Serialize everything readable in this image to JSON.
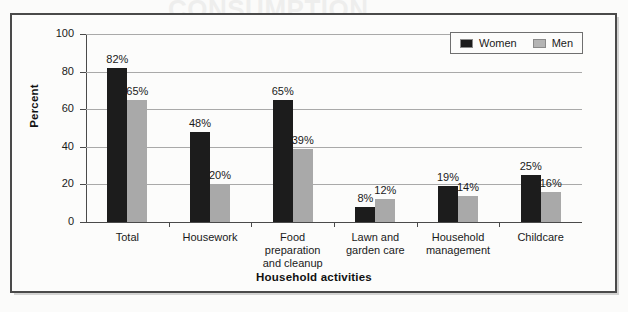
{
  "chart_data": {
    "type": "bar",
    "title": "",
    "xlabel": "Household activities",
    "ylabel": "Percent",
    "ylim": [
      0,
      100
    ],
    "yticks": [
      "0",
      "20",
      "40",
      "60",
      "80",
      "100"
    ],
    "grid": true,
    "legend_position": "top-right",
    "value_suffix": "%",
    "categories": [
      "Total",
      "Housework",
      "Food preparation and cleanup",
      "Lawn and garden care",
      "Household management",
      "Childcare"
    ],
    "category_lines": [
      [
        "Total"
      ],
      [
        "Housework"
      ],
      [
        "Food",
        "preparation",
        "and cleanup"
      ],
      [
        "Lawn and",
        "garden care"
      ],
      [
        "Household",
        "management"
      ],
      [
        "Childcare"
      ]
    ],
    "series": [
      {
        "name": "Women",
        "color": "#1c1c1c",
        "values": [
          82,
          48,
          65,
          8,
          19,
          25
        ],
        "labels": [
          "82%",
          "48%",
          "65%",
          "8%",
          "19%",
          "25%"
        ]
      },
      {
        "name": "Men",
        "color": "#a9a9a9",
        "values": [
          65,
          20,
          39,
          12,
          14,
          16
        ],
        "labels": [
          "65%",
          "20%",
          "39%",
          "12%",
          "14%",
          "16%"
        ]
      }
    ]
  },
  "legend": {
    "entries": [
      {
        "label": "Women",
        "color": "#1c1c1c"
      },
      {
        "label": "Men",
        "color": "#b4b4b4"
      }
    ]
  },
  "background_bleed": {
    "line1": "CONSUMPTION",
    "line2": "AND TIME USE",
    "line3": "activities than men, and they",
    "line4": "spent more time on these",
    "line5": "women spent more time on",
    "line6": "housework and food preparation",
    "line7": "percent of men"
  }
}
